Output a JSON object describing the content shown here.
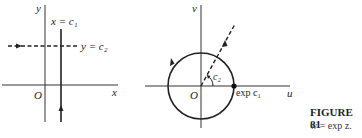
{
  "left_panel": {
    "y_axis_label": "y",
    "x_axis_label": "x",
    "origin_label": "O",
    "vertical_line_label": "x = c₁",
    "horizontal_line_label": "y = c₂"
  },
  "right_panel": {
    "v_axis_label": "v",
    "u_axis_label": "u",
    "origin_label": "O",
    "angle_label": "c₂",
    "point_label": "exp c₁"
  },
  "caption": {
    "title": "FIGURE 81",
    "subtitle": "w = exp z."
  }
}
